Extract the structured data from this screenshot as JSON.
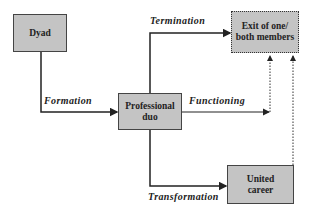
{
  "nodes": {
    "dyad": {
      "label": "Dyad"
    },
    "duo": {
      "line1": "Professional",
      "line2": "duo"
    },
    "exit": {
      "line1": "Exit of one/",
      "line2": "both members"
    },
    "united": {
      "line1": "United",
      "line2": "career"
    }
  },
  "edges": {
    "formation": "Formation",
    "termination": "Termination",
    "functioning": "Functioning",
    "transformation": "Transformation"
  },
  "colors": {
    "box_fill": "#c4c4c4",
    "line": "#222222"
  }
}
